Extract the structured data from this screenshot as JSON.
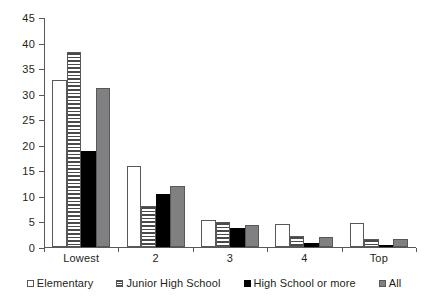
{
  "chart_data": {
    "type": "bar",
    "title": "",
    "subtitle": "",
    "xlabel": "",
    "ylabel": "",
    "categories": [
      "Lowest",
      "2",
      "3",
      "4",
      "Top"
    ],
    "series": [
      {
        "name": "Elementary",
        "color": "#ffffff",
        "values": [
          32.7,
          15.8,
          5.2,
          4.5,
          4.7
        ]
      },
      {
        "name": "Junior High School",
        "color": "#ffffff",
        "values": [
          38.2,
          8.0,
          4.9,
          2.1,
          1.5
        ]
      },
      {
        "name": "High School or more",
        "color": "#000000",
        "values": [
          18.7,
          10.3,
          3.7,
          0.7,
          0.15
        ]
      },
      {
        "name": "All",
        "color": "#808082",
        "values": [
          31.2,
          11.9,
          4.4,
          1.9,
          1.5
        ]
      }
    ],
    "ylim": [
      0,
      45
    ],
    "yticks": [
      0,
      5,
      10,
      15,
      20,
      25,
      30,
      35,
      40,
      45
    ],
    "ytick_labels": [
      "0",
      "5",
      "10",
      "15",
      "20",
      "25",
      "30",
      "35",
      "40",
      "45"
    ],
    "grid": false,
    "legend_position": "bottom"
  },
  "legend": {
    "items": [
      {
        "label": "Elementary",
        "marker": "open-square-swatch"
      },
      {
        "label": "Junior High School",
        "marker": "striped-square-swatch"
      },
      {
        "label": "High School or more",
        "marker": "filled-black-square-swatch"
      },
      {
        "label": "All",
        "marker": "gray-square-swatch"
      }
    ]
  }
}
